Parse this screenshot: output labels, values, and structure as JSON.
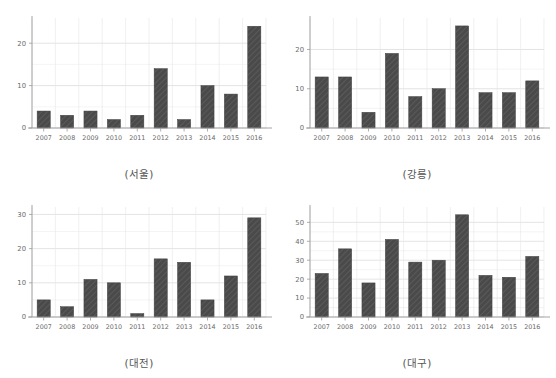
{
  "figure": {
    "panel_count": 4,
    "bar_color": "#4a4a4a",
    "grid_color": "#d8d8d8",
    "axis_color": "#9a9a9a",
    "background": "#ffffff"
  },
  "panels": [
    {
      "caption": "(서울)",
      "name": "seoul"
    },
    {
      "caption": "(강릉)",
      "name": "gangneung"
    },
    {
      "caption": "(대전)",
      "name": "daejeon"
    },
    {
      "caption": "(대구)",
      "name": "daegu"
    }
  ],
  "chart_data": [
    {
      "type": "bar",
      "title": "(서울)",
      "categories": [
        "2007",
        "2008",
        "2009",
        "2010",
        "2011",
        "2012",
        "2013",
        "2014",
        "2015",
        "2016"
      ],
      "values": [
        4,
        3,
        4,
        2,
        3,
        14,
        2,
        10,
        8,
        24
      ],
      "xlabel": "",
      "ylabel": "",
      "ylim": [
        0,
        25
      ],
      "yticks": [
        0,
        10,
        20
      ],
      "grid": true,
      "legend": "none"
    },
    {
      "type": "bar",
      "title": "(강릉)",
      "categories": [
        "2007",
        "2008",
        "2009",
        "2010",
        "2011",
        "2012",
        "2013",
        "2014",
        "2015",
        "2016"
      ],
      "values": [
        13,
        13,
        4,
        19,
        8,
        10,
        26,
        9,
        9,
        12
      ],
      "xlabel": "",
      "ylabel": "",
      "ylim": [
        0,
        27
      ],
      "yticks": [
        0,
        10,
        20
      ],
      "grid": true,
      "legend": "none"
    },
    {
      "type": "bar",
      "title": "(대전)",
      "categories": [
        "2007",
        "2008",
        "2009",
        "2010",
        "2011",
        "2012",
        "2013",
        "2014",
        "2015",
        "2016"
      ],
      "values": [
        5,
        3,
        11,
        10,
        1,
        17,
        16,
        5,
        12,
        29
      ],
      "xlabel": "",
      "ylabel": "",
      "ylim": [
        0,
        31
      ],
      "yticks": [
        0,
        10,
        20,
        30
      ],
      "grid": true,
      "legend": "none"
    },
    {
      "type": "bar",
      "title": "(대구)",
      "categories": [
        "2007",
        "2008",
        "2009",
        "2010",
        "2011",
        "2012",
        "2013",
        "2014",
        "2015",
        "2016"
      ],
      "values": [
        23,
        36,
        18,
        41,
        29,
        30,
        54,
        22,
        21,
        32
      ],
      "xlabel": "",
      "ylabel": "",
      "ylim": [
        0,
        56
      ],
      "yticks": [
        0,
        10,
        20,
        30,
        40,
        50
      ],
      "grid": true,
      "legend": "none"
    }
  ]
}
